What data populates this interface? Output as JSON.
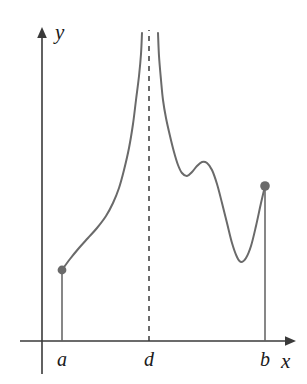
{
  "figure": {
    "background_color": "#ffffff",
    "curve_color": "#6a6a6a",
    "axis_color": "#3a3a3a",
    "label_color": "#1a1a1a",
    "width": 307,
    "height": 384
  },
  "axes": {
    "y_label": "y",
    "x_label": "x",
    "x_axis_y_px": 341,
    "y_axis_x_px": 42
  },
  "ticks": [
    {
      "name": "a",
      "label": "a",
      "x_px": 62
    },
    {
      "name": "d",
      "label": "d",
      "x_px": 149
    },
    {
      "name": "b",
      "label": "b",
      "x_px": 265
    }
  ],
  "chart_data": {
    "type": "line",
    "title": "",
    "xlabel": "x",
    "ylabel": "y",
    "grid": false,
    "legend": null,
    "xlim": [
      42,
      287
    ],
    "ylim": [
      341,
      30
    ],
    "axis_orientation": "screen-pixels-y-down",
    "annotations": [
      {
        "name": "vertical-asymptote",
        "style": "dashed",
        "x_px": 149,
        "label": "d"
      },
      {
        "name": "left-drop-line",
        "style": "solid",
        "x_px": 62,
        "from_y_px": 341,
        "to_y_px": 270
      },
      {
        "name": "right-drop-line",
        "style": "solid",
        "x_px": 265,
        "from_y_px": 341,
        "to_y_px": 186
      },
      {
        "name": "endpoint-dot-a",
        "style": "filled-dot",
        "x_px": 62,
        "y_px": 270
      },
      {
        "name": "endpoint-dot-b",
        "style": "filled-dot",
        "x_px": 265,
        "y_px": 186
      }
    ],
    "series": [
      {
        "name": "branch-left",
        "points_px": [
          [
            62,
            270
          ],
          [
            70,
            259
          ],
          [
            79,
            248
          ],
          [
            88,
            238
          ],
          [
            97,
            228
          ],
          [
            106,
            216
          ],
          [
            113,
            203
          ],
          [
            119,
            188
          ],
          [
            124,
            170
          ],
          [
            129,
            148
          ],
          [
            133,
            124
          ],
          [
            136,
            100
          ],
          [
            139,
            76
          ],
          [
            141,
            54
          ],
          [
            142,
            33
          ]
        ]
      },
      {
        "name": "branch-right",
        "points_px": [
          [
            158,
            33
          ],
          [
            159,
            56
          ],
          [
            161,
            80
          ],
          [
            163,
            100
          ],
          [
            166,
            118
          ],
          [
            170,
            136
          ],
          [
            174,
            152
          ],
          [
            178,
            165
          ],
          [
            182,
            173
          ],
          [
            187,
            176
          ],
          [
            192,
            172
          ],
          [
            197,
            166
          ],
          [
            202,
            162
          ],
          [
            207,
            163
          ],
          [
            212,
            170
          ],
          [
            217,
            184
          ],
          [
            222,
            203
          ],
          [
            227,
            223
          ],
          [
            232,
            243
          ],
          [
            237,
            257
          ],
          [
            241,
            262
          ],
          [
            246,
            258
          ],
          [
            251,
            246
          ],
          [
            256,
            226
          ],
          [
            261,
            203
          ],
          [
            265,
            186
          ]
        ]
      }
    ]
  }
}
